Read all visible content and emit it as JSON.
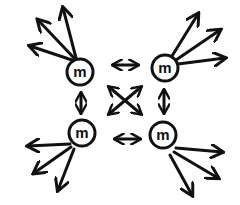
{
  "diagram": {
    "stroke_color": "#111111",
    "background": "#ffffff",
    "nodes": [
      {
        "id": "top-left",
        "label": "m",
        "cx": 80,
        "cy": 72
      },
      {
        "id": "top-right",
        "label": "m",
        "cx": 165,
        "cy": 68
      },
      {
        "id": "bottom-left",
        "label": "m",
        "cx": 82,
        "cy": 133
      },
      {
        "id": "bottom-right",
        "label": "m",
        "cx": 163,
        "cy": 135
      }
    ],
    "connections": [
      {
        "from": "top-left",
        "to": "top-right",
        "type": "double-arrow"
      },
      {
        "from": "bottom-left",
        "to": "bottom-right",
        "type": "double-arrow"
      },
      {
        "from": "top-left",
        "to": "bottom-left",
        "type": "double-arrow"
      },
      {
        "from": "top-right",
        "to": "bottom-right",
        "type": "double-arrow"
      },
      {
        "from": "top-left",
        "to": "bottom-right",
        "type": "double-arrow"
      },
      {
        "from": "top-right",
        "to": "bottom-left",
        "type": "double-arrow"
      }
    ],
    "outward_arrows_per_node": 3
  }
}
